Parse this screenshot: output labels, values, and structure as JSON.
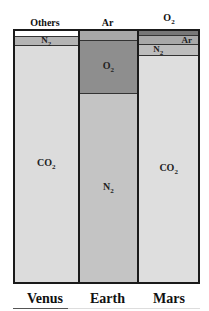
{
  "chart_data": {
    "type": "bar",
    "subtype": "100% stacked column",
    "title": "",
    "categories": [
      "Venus",
      "Earth",
      "Mars"
    ],
    "series": [
      {
        "name": "CO2",
        "values": [
          96.5,
          0.04,
          95.3
        ]
      },
      {
        "name": "N2",
        "values": [
          3.5,
          78.1,
          2.7
        ]
      },
      {
        "name": "O2",
        "values": [
          0,
          20.9,
          0.13
        ]
      },
      {
        "name": "Ar",
        "values": [
          0.007,
          0.93,
          1.6
        ]
      },
      {
        "name": "Others",
        "values": [
          0.01,
          0.03,
          0.1
        ]
      }
    ],
    "top_labels": {
      "Venus": "Others",
      "Earth": "Ar",
      "Mars": "O2"
    },
    "ylim": [
      0,
      100
    ],
    "grid": false,
    "legend": "none (labels inside segments)"
  },
  "top_labels": [
    "Others",
    "Ar",
    "O2"
  ],
  "bottom_labels": [
    "Venus",
    "Earth",
    "Mars"
  ],
  "columns": [
    {
      "planet": "Venus",
      "segments": [
        {
          "gas": "Others",
          "label": "",
          "pct": 2.5,
          "color": "#ffffff"
        },
        {
          "gas": "N2",
          "label": "N",
          "sub": "2",
          "pct": 3.5,
          "color": "#b4b4b4"
        },
        {
          "gas": "CO2",
          "label": "CO",
          "sub": "2",
          "pct": 94,
          "color": "#dcdcdc"
        }
      ]
    },
    {
      "planet": "Earth",
      "segments": [
        {
          "gas": "Ar",
          "label": "",
          "pct": 4,
          "color": "#a8a8a8"
        },
        {
          "gas": "O2",
          "label": "O",
          "sub": "2",
          "pct": 21,
          "color": "#8e8e8e"
        },
        {
          "gas": "N2",
          "label": "N",
          "sub": "2",
          "pct": 75,
          "color": "#c4c4c4"
        }
      ]
    },
    {
      "planet": "Mars",
      "segments": [
        {
          "gas": "O2",
          "label": "",
          "pct": 2,
          "color": "#777777"
        },
        {
          "gas": "Ar",
          "label": "Ar",
          "sub": "",
          "pct": 3.5,
          "color": "#a8a8a8",
          "align": "right"
        },
        {
          "gas": "N2",
          "label": "N",
          "sub": "2",
          "pct": 4.5,
          "color": "#bdbdbd",
          "align": "left"
        },
        {
          "gas": "CO2",
          "label": "CO",
          "sub": "2",
          "pct": 90,
          "color": "#dedede"
        }
      ]
    }
  ]
}
